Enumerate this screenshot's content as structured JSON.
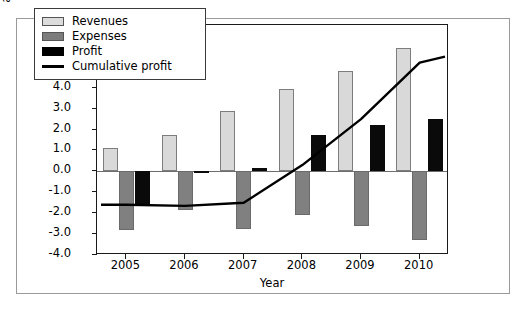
{
  "chart_data": {
    "type": "bar",
    "title": "",
    "xlabel": "Year",
    "ylabel": "Revenues, expenses, profit,\nand cumulative profit ($B)",
    "categories": [
      "2005",
      "2006",
      "2007",
      "2008",
      "2009",
      "2010"
    ],
    "ylim": [
      -4.0,
      7.0
    ],
    "yticks": [
      "7.0",
      "6.0",
      "5.0",
      "4.0",
      "3.0",
      "2.0",
      "1.0",
      "0.0",
      "-1.0",
      "-2.0",
      "-3.0",
      "-4.0"
    ],
    "ytick_values": [
      7.0,
      6.0,
      5.0,
      4.0,
      3.0,
      2.0,
      1.0,
      0.0,
      -1.0,
      -2.0,
      -3.0,
      -4.0
    ],
    "grid": false,
    "legend_position": "top-left-inside",
    "series": [
      {
        "name": "Revenues",
        "kind": "bar",
        "color": "#d9d9d9",
        "values": [
          1.1,
          1.75,
          2.9,
          3.95,
          4.8,
          5.9
        ]
      },
      {
        "name": "Expenses",
        "kind": "bar",
        "color": "#808080",
        "values": [
          -2.8,
          -1.85,
          -2.75,
          -2.1,
          -2.6,
          -3.3
        ]
      },
      {
        "name": "Profit",
        "kind": "bar",
        "color": "#0a0a0a",
        "values": [
          -1.6,
          -0.05,
          0.15,
          1.75,
          2.2,
          2.5
        ]
      },
      {
        "name": "Cumulative profit",
        "kind": "line",
        "color": "#000000",
        "values": [
          -1.6,
          -1.65,
          -1.5,
          0.3,
          2.5,
          5.2
        ]
      }
    ]
  },
  "legend": {
    "items": [
      {
        "label": "Revenues",
        "swatch": "rev"
      },
      {
        "label": "Expenses",
        "swatch": "exp"
      },
      {
        "label": "Profit",
        "swatch": "pro"
      },
      {
        "label": "Cumulative profit",
        "swatch": "line"
      }
    ]
  }
}
